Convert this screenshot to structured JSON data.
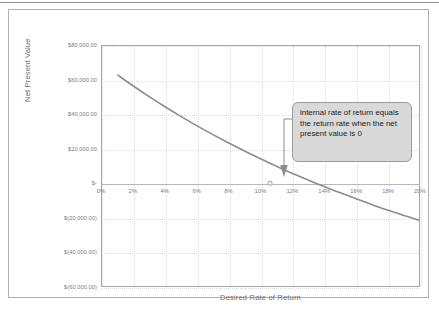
{
  "chart_data": {
    "type": "line",
    "title": "",
    "xlabel": "Desired Rate of Return",
    "ylabel": "Net Present Value",
    "xlim": [
      0,
      20
    ],
    "ylim": [
      -60000,
      80000
    ],
    "grid": true,
    "legend": "none",
    "x_tick_labels": [
      "0%",
      "2%",
      "4%",
      "6%",
      "8%",
      "10%",
      "12%",
      "14%",
      "16%",
      "18%",
      "20%"
    ],
    "x_tick_values": [
      0,
      2,
      4,
      6,
      8,
      10,
      12,
      14,
      16,
      18,
      20
    ],
    "y_tick_labels": [
      "$80,000.00",
      "$60,000.00",
      "$40,000.00",
      "$20,000.00",
      "$-",
      "$(20,000.00)",
      "$(40,000.00)",
      "$(60,000.00)"
    ],
    "y_tick_values": [
      80000,
      60000,
      40000,
      20000,
      0,
      -20000,
      -40000,
      -60000
    ],
    "series": [
      {
        "name": "Net Present Value",
        "color": "#8c8c8c",
        "x": [
          1,
          2,
          3,
          4,
          5,
          6,
          7,
          8,
          9,
          10,
          10.6,
          11,
          12,
          13,
          14,
          15,
          16,
          17,
          18,
          19,
          20
        ],
        "values": [
          63000,
          56500,
          50300,
          44400,
          38800,
          33400,
          28300,
          23400,
          18700,
          14200,
          11600,
          9900,
          5800,
          1900,
          -1900,
          -5500,
          -9000,
          -12400,
          -15600,
          -18700,
          -21700
        ]
      }
    ],
    "annotations": [
      {
        "name": "irr-callout",
        "text": "internal rate of return equals the return rate when the net present value is 0",
        "points_to_x": 10.6,
        "points_to_y": 0,
        "marker": "open-circle"
      }
    ]
  },
  "chart": {
    "y_axis_title": "Net Present Value",
    "x_axis_title": "Desired Rate of Return",
    "callout_text": "internal rate of return equals the return rate when the net present value is 0",
    "colors": {
      "series": "#8c8c8c",
      "gridline": "#dcdcdc",
      "axis": "#b0b0b0",
      "callout_fill": "#d9d9d9",
      "callout_border": "#9a9a9a",
      "tick_text": "#7a7a7a"
    }
  }
}
